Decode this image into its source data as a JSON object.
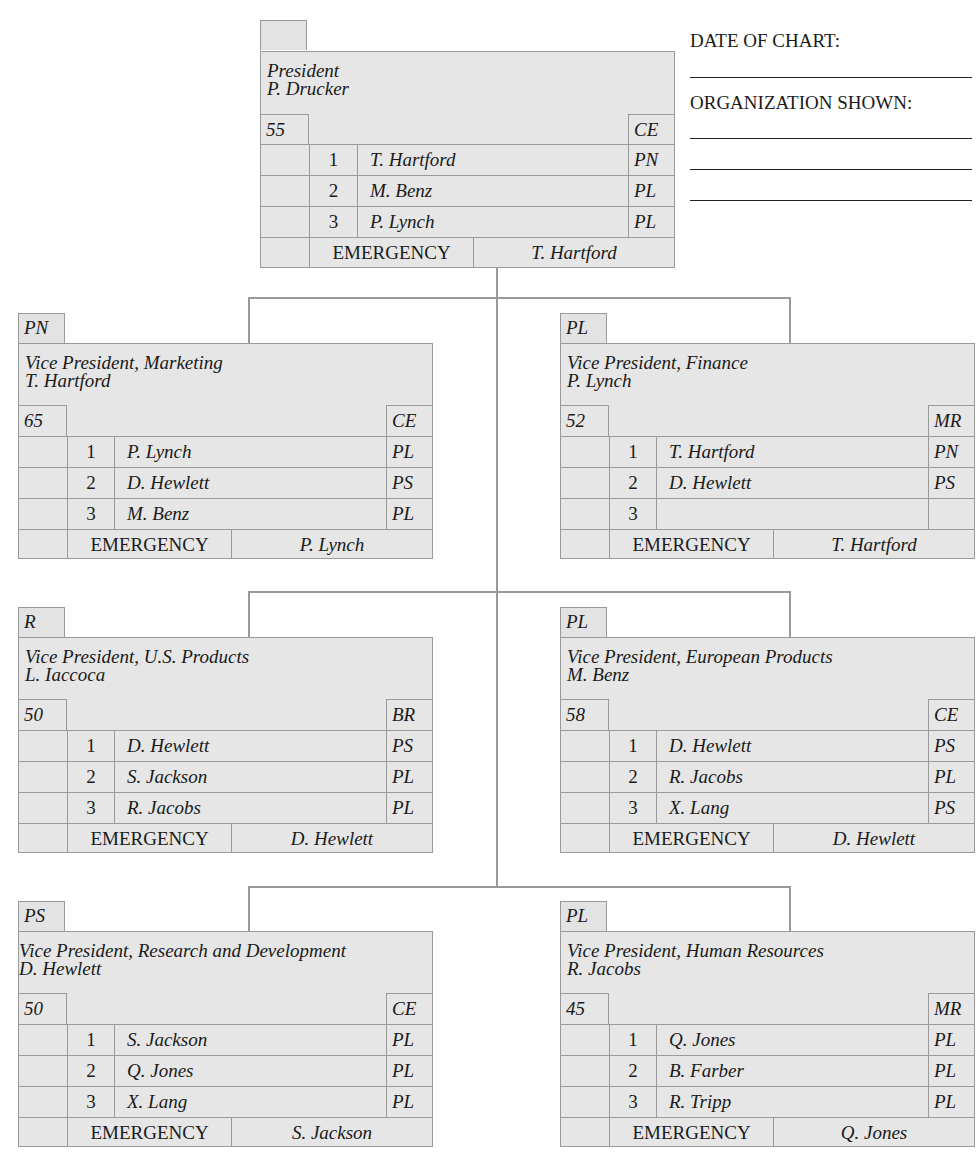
{
  "form": {
    "date_label": "DATE OF CHART:",
    "org_label": "ORGANIZATION SHOWN:",
    "date_value": "",
    "org_values": [
      "",
      "",
      ""
    ]
  },
  "colors": {
    "box_fill": "#e6e6e6",
    "box_border": "#9a9a9a",
    "connector": "#9a9a9a",
    "text": "#1a1a1a"
  },
  "president": {
    "code_tab": "",
    "title": "President",
    "name": "P. Drucker",
    "age": "55",
    "readiness": "CE",
    "successors": [
      {
        "rank": "1",
        "name": "T. Hartford",
        "code": "PN"
      },
      {
        "rank": "2",
        "name": "M. Benz",
        "code": "PL"
      },
      {
        "rank": "3",
        "name": "P. Lynch",
        "code": "PL"
      }
    ],
    "emergency_label": "EMERGENCY",
    "emergency_name": "T. Hartford"
  },
  "vps": [
    {
      "code_tab": "PN",
      "title": "Vice President, Marketing",
      "name": "T. Hartford",
      "age": "65",
      "readiness": "CE",
      "successors": [
        {
          "rank": "1",
          "name": "P. Lynch",
          "code": "PL"
        },
        {
          "rank": "2",
          "name": "D. Hewlett",
          "code": "PS"
        },
        {
          "rank": "3",
          "name": "M. Benz",
          "code": "PL"
        }
      ],
      "emergency_label": "EMERGENCY",
      "emergency_name": "P. Lynch"
    },
    {
      "code_tab": "PL",
      "title": "Vice President, Finance",
      "name": "P. Lynch",
      "age": "52",
      "readiness": "MR",
      "successors": [
        {
          "rank": "1",
          "name": "T. Hartford",
          "code": "PN"
        },
        {
          "rank": "2",
          "name": "D. Hewlett",
          "code": "PS"
        },
        {
          "rank": "3",
          "name": "",
          "code": ""
        }
      ],
      "emergency_label": "EMERGENCY",
      "emergency_name": "T. Hartford"
    },
    {
      "code_tab": "R",
      "title": "Vice President, U.S. Products",
      "name": "L. Iaccoca",
      "age": "50",
      "readiness": "BR",
      "successors": [
        {
          "rank": "1",
          "name": "D. Hewlett",
          "code": "PS"
        },
        {
          "rank": "2",
          "name": "S. Jackson",
          "code": "PL"
        },
        {
          "rank": "3",
          "name": "R. Jacobs",
          "code": "PL"
        }
      ],
      "emergency_label": "EMERGENCY",
      "emergency_name": "D. Hewlett"
    },
    {
      "code_tab": "PL",
      "title": "Vice President, European Products",
      "name": "M. Benz",
      "age": "58",
      "readiness": "CE",
      "successors": [
        {
          "rank": "1",
          "name": "D. Hewlett",
          "code": "PS"
        },
        {
          "rank": "2",
          "name": "R. Jacobs",
          "code": "PL"
        },
        {
          "rank": "3",
          "name": "X. Lang",
          "code": "PS"
        }
      ],
      "emergency_label": "EMERGENCY",
      "emergency_name": "D. Hewlett"
    },
    {
      "code_tab": "PS",
      "title": "Vice President, Research and Development",
      "name": "D. Hewlett",
      "age": "50",
      "readiness": "CE",
      "successors": [
        {
          "rank": "1",
          "name": "S. Jackson",
          "code": "PL"
        },
        {
          "rank": "2",
          "name": "Q. Jones",
          "code": "PL"
        },
        {
          "rank": "3",
          "name": "X. Lang",
          "code": "PL"
        }
      ],
      "emergency_label": "EMERGENCY",
      "emergency_name": "S. Jackson"
    },
    {
      "code_tab": "PL",
      "title": "Vice President, Human Resources",
      "name": "R. Jacobs",
      "age": "45",
      "readiness": "MR",
      "successors": [
        {
          "rank": "1",
          "name": "Q. Jones",
          "code": "PL"
        },
        {
          "rank": "2",
          "name": "B. Farber",
          "code": "PL"
        },
        {
          "rank": "3",
          "name": "R. Tripp",
          "code": "PL"
        }
      ],
      "emergency_label": "EMERGENCY",
      "emergency_name": "Q. Jones"
    }
  ]
}
